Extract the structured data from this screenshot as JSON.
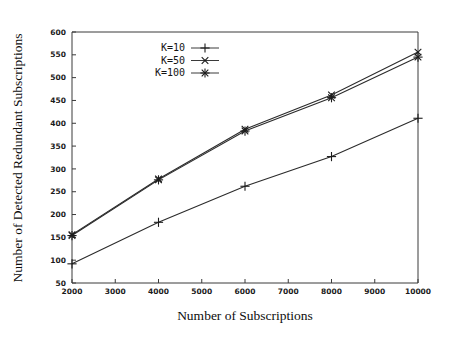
{
  "chart_data": {
    "type": "line",
    "title": "",
    "xlabel": "Number of Subscriptions",
    "ylabel": "Number of Detected Redundant Subscriptions",
    "x": [
      2000,
      4000,
      6000,
      8000,
      10000
    ],
    "xlim": [
      2000,
      10000
    ],
    "ylim": [
      50,
      600
    ],
    "xticks": [
      "2000",
      "3000",
      "4000",
      "5000",
      "6000",
      "7000",
      "8000",
      "9000",
      "10000"
    ],
    "yticks": [
      "50",
      "100",
      "150",
      "200",
      "250",
      "300",
      "350",
      "400",
      "450",
      "500",
      "550",
      "600"
    ],
    "grid": false,
    "legend_position": "top-left-inside",
    "series": [
      {
        "name": "K=10",
        "marker": "plus",
        "values": [
          92,
          183,
          262,
          327,
          411
        ]
      },
      {
        "name": "K=50",
        "marker": "cross",
        "values": [
          156,
          278,
          387,
          462,
          556
        ]
      },
      {
        "name": "K=100",
        "marker": "asterisk",
        "values": [
          154,
          276,
          383,
          456,
          545
        ]
      }
    ]
  },
  "figure": {
    "xlabel": "Number of Subscriptions",
    "ylabel": "Number of Detected Redundant Subscriptions",
    "legend": [
      {
        "label": "K=10"
      },
      {
        "label": "K=50"
      },
      {
        "label": "K=100"
      }
    ],
    "xticks": [
      "2000",
      "3000",
      "4000",
      "5000",
      "6000",
      "7000",
      "8000",
      "9000",
      "10000"
    ],
    "yticks": [
      "600",
      "550",
      "500",
      "450",
      "400",
      "350",
      "300",
      "250",
      "200",
      "150",
      "100",
      "50"
    ]
  },
  "colors": {
    "ink": "#2b2b2b",
    "background": "#ffffff"
  }
}
